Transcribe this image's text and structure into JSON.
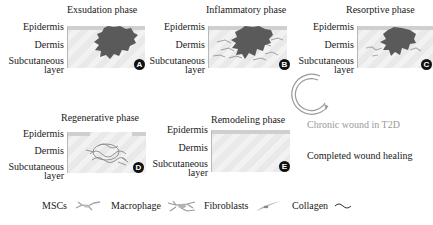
{
  "diagram": {
    "layer_labels": {
      "epidermis": "Epidermis",
      "dermis": "Dermis",
      "subcutaneous": "Subcutaneous",
      "layer": "layer"
    },
    "phases": [
      {
        "id": "A",
        "title": "Exsudation phase",
        "badge": "A"
      },
      {
        "id": "B",
        "title": "Inflammatory phase",
        "badge": "B"
      },
      {
        "id": "C",
        "title": "Resorptive phase",
        "badge": "C"
      },
      {
        "id": "D",
        "title": "Regenerative phase",
        "badge": "D"
      },
      {
        "id": "E",
        "title": "Remodeling phase",
        "badge": "E"
      }
    ],
    "chronic_label": "Chronic wound in T2D",
    "completed_label": "Completed wound healing",
    "legend": [
      {
        "label": "MSCs",
        "icon": "msc-cell-icon"
      },
      {
        "label": "Macrophage",
        "icon": "macrophage-icon"
      },
      {
        "label": "Fibroblasts",
        "icon": "fibroblast-icon"
      },
      {
        "label": "Collagen",
        "icon": "collagen-wave-icon"
      }
    ],
    "colors": {
      "wound": "#5a5a5a",
      "tissue": "#ececec",
      "epidermis": "#cfcfcf",
      "badge": "#111111",
      "chronic_text": "#9a9a9a"
    }
  }
}
